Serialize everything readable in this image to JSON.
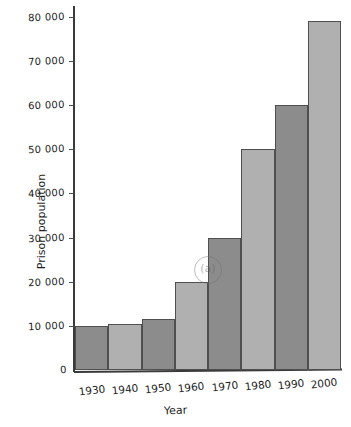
{
  "chart_data": {
    "type": "bar",
    "title": "",
    "xlabel": "Year",
    "ylabel": "Prison population",
    "categories": [
      "1930",
      "1940",
      "1950",
      "1960",
      "1970",
      "1980",
      "1990",
      "2000"
    ],
    "values": [
      10000,
      10500,
      11500,
      20000,
      30000,
      50000,
      60000,
      79000
    ],
    "ylim": [
      0,
      82000
    ],
    "xlim_note": "categorical",
    "y_ticks": [
      0,
      10000,
      20000,
      30000,
      40000,
      50000,
      60000,
      70000,
      80000
    ],
    "y_tick_labels": [
      "0",
      "10 000",
      "20 000",
      "30 000",
      "40 000",
      "50 000",
      "60 000",
      "70 000",
      "80 000"
    ],
    "grid": false,
    "legend": null,
    "bar_colors": [
      "#8c8c8c",
      "#b0b0b0",
      "#8c8c8c",
      "#b0b0b0",
      "#8c8c8c",
      "#b0b0b0",
      "#8c8c8c",
      "#b0b0b0"
    ],
    "bar_edge_color": "#4f4f4f",
    "axis_color": "#3a3a3a",
    "background_color": "#ffffff",
    "annotations": [
      "(a)"
    ]
  },
  "axes": {
    "y_title": "Prison population",
    "x_title": "Year",
    "zero_label": "0"
  },
  "watermark": {
    "symbol": "(a)"
  }
}
